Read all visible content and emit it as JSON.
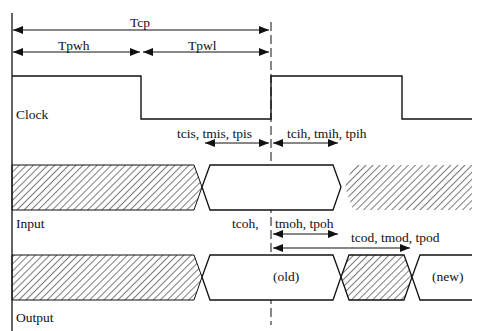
{
  "diagram": {
    "colors": {
      "line": "#111111",
      "hatch": "#333333",
      "background": "#ffffff"
    },
    "signals": [
      {
        "id": "clock",
        "label": "Clock"
      },
      {
        "id": "input",
        "label": "Input"
      },
      {
        "id": "output",
        "label": "Output"
      }
    ],
    "period_labels": {
      "tcp": "Tcp",
      "tpwh": "Tpwh",
      "tpwl": "Tpwl"
    },
    "input_timing": {
      "setup": "tcis, tmis, tpis",
      "hold": "tcih, tmih, tpih"
    },
    "output_timing": {
      "hold_prefix": "tcoh,",
      "hold": "tmoh, tpoh",
      "delay": "tcod, tmod, tpod",
      "old_value": "(old)",
      "new_value": "(new)"
    }
  }
}
